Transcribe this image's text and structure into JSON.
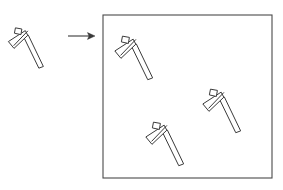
{
  "figure": {
    "background_color": "#ffffff",
    "line_color": "#3a3a3a",
    "canvas": {
      "width": 283,
      "height": 190
    }
  },
  "source_object": {
    "label": "hammer-tool",
    "position": {
      "x": 15,
      "y": 24
    },
    "rotation_deg": 28,
    "scale": 1.0
  },
  "arrow": {
    "label": "transform-arrow",
    "direction": "right",
    "start": {
      "x": 68,
      "y": 36
    },
    "end": {
      "x": 95,
      "y": 36
    }
  },
  "container": {
    "label": "output-region",
    "shape": "rectangle",
    "x": 103,
    "y": 15,
    "width": 169,
    "height": 163,
    "stroke": "#4a4a4a",
    "fill": "#ffffff"
  },
  "placed_objects": [
    {
      "label": "hammer-tool-1",
      "position": {
        "x": 122,
        "y": 32
      },
      "rotation_deg": 28,
      "scale": 1.08
    },
    {
      "label": "hammer-tool-2",
      "position": {
        "x": 210,
        "y": 85
      },
      "rotation_deg": 28,
      "scale": 1.08
    },
    {
      "label": "hammer-tool-3",
      "position": {
        "x": 153,
        "y": 118
      },
      "rotation_deg": 28,
      "scale": 1.08
    }
  ],
  "tool_geometry": {
    "handle_outline": "M 13.5 7.2 L 17.0 3.6 L 45.0 24.2 L 41.8 27.8 Z",
    "head_blade_outline": "M 12.2 1.0 L 16.6 4.0 L 10.6 22.0 L 2.4 18.6 Z",
    "head_tab_outline": "M 2.2 3.2 L 8.4 1.2 L 10.2 6.6 L 3.8 8.4 Z",
    "head_spike_line": "M 14.6 0.0 L 9.0 19.8"
  }
}
